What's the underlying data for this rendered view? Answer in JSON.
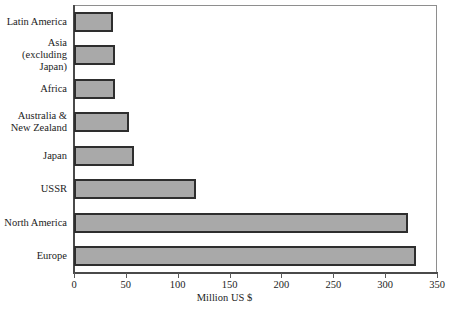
{
  "chart_data": {
    "type": "bar",
    "orientation": "horizontal",
    "title": "",
    "xlabel": "Million US $",
    "ylabel": "",
    "xlim": [
      0,
      350
    ],
    "xticks": [
      0,
      50,
      100,
      150,
      200,
      250,
      300,
      350
    ],
    "grid": false,
    "legend": null,
    "categories": [
      "Latin America",
      "Asia (excluding Japan)",
      "Africa",
      "Australia & New Zealand",
      "Japan",
      "USSR",
      "North America",
      "Europe"
    ],
    "category_lines": [
      [
        "Latin America"
      ],
      [
        "Asia",
        "(excluding Japan)"
      ],
      [
        "Africa"
      ],
      [
        "Australia &",
        "New Zealand"
      ],
      [
        "Japan"
      ],
      [
        "USSR"
      ],
      [
        "North America"
      ],
      [
        "Europe"
      ]
    ],
    "values": [
      38,
      40,
      40,
      53,
      58,
      118,
      322,
      330
    ],
    "bar_fill": "#a9a9a9",
    "bar_border": "#2e2e2e",
    "axis_color": "#4a4a4a"
  }
}
